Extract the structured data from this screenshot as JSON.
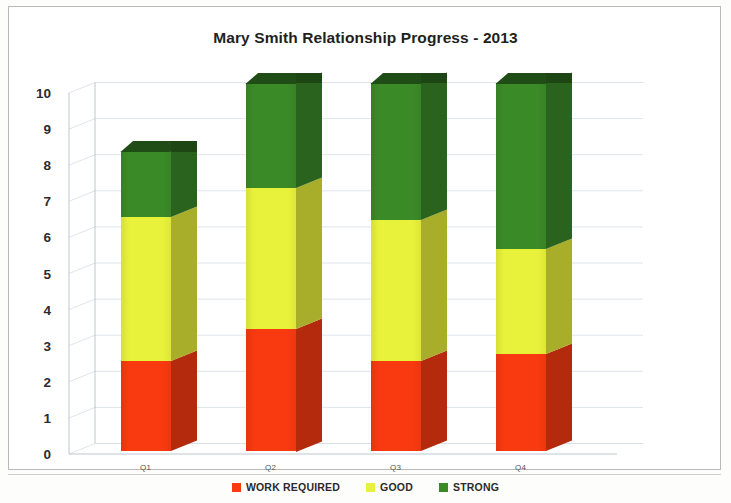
{
  "chart_data": {
    "type": "bar",
    "subtype": "stacked-column-3d",
    "title": "Mary Smith Relationship Progress - 2013",
    "xlabel": "",
    "ylabel": "",
    "ylim": [
      0,
      10
    ],
    "ytick_labels": [
      "10",
      "9",
      "8",
      "7",
      "6",
      "5",
      "4",
      "3",
      "2",
      "1",
      "0"
    ],
    "ytick_values": [
      10,
      9,
      8,
      7,
      6,
      5,
      4,
      3,
      2,
      1,
      0
    ],
    "grid": true,
    "legend_position": "bottom",
    "categories": [
      "Q1",
      "Q2",
      "Q3",
      "Q4"
    ],
    "series": [
      {
        "name": "WORK REQUIRED",
        "color": "#F93A10",
        "values": [
          2.5,
          3.4,
          2.5,
          2.7
        ]
      },
      {
        "name": "GOOD",
        "color": "#E9F23A",
        "values": [
          4.0,
          3.9,
          3.9,
          2.9
        ]
      },
      {
        "name": "STRONG",
        "color": "#3B8A28",
        "values": [
          1.8,
          2.9,
          3.8,
          4.6
        ]
      }
    ],
    "totals": [
      8.3,
      10.2,
      10.2,
      10.2
    ]
  },
  "legend": {
    "items": [
      {
        "label": "WORK REQUIRED",
        "color": "#F93A10"
      },
      {
        "label": "GOOD",
        "color": "#E9F23A"
      },
      {
        "label": "STRONG",
        "color": "#3B8A28"
      }
    ]
  },
  "colors": {
    "work_required": "#F93A10",
    "good": "#E9F23A",
    "strong": "#3B8A28",
    "background": "#ffffff",
    "gridline": "#d7dde4",
    "axis": "#b8c0c8",
    "title_text": "#231f20"
  }
}
